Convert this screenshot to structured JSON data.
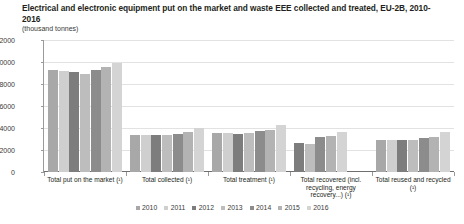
{
  "chart_data": {
    "type": "bar",
    "title": "Electrical and electronic equipment put on the market and waste EEE collected and treated, EU-2B, 2010-2016",
    "subtitle": "(thousand tonnes)",
    "xlabel": "",
    "ylabel": "",
    "unit": "thousand tonnes",
    "ylim": [
      0,
      12000
    ],
    "ytick_labels": [
      "12000",
      "10000",
      "8000",
      "6000",
      "4000",
      "2000",
      "0"
    ],
    "ytick_values": [
      12000,
      10000,
      8000,
      6000,
      4000,
      2000,
      0
    ],
    "grid": true,
    "legend_position": "bottom",
    "categories": [
      "Total put on the market (¹)",
      "Total collected (¹)",
      "Total treatment (¹)",
      "Total recovered (incl. recycling, energy recovery...) (¹)",
      "Total reused and recycled (¹)"
    ],
    "series": [
      {
        "name": "2010",
        "color": "#a8a8a8",
        "values": [
          9300,
          3400,
          3550,
          null,
          2950
        ]
      },
      {
        "name": "2011",
        "color": "#cfcfcf",
        "values": [
          9200,
          3400,
          3550,
          null,
          2950
        ]
      },
      {
        "name": "2012",
        "color": "#7d7d7d",
        "values": [
          9100,
          3400,
          3500,
          2600,
          2900
        ]
      },
      {
        "name": "2013",
        "color": "#bdbdbd",
        "values": [
          8950,
          3400,
          3550,
          2550,
          2950
        ]
      },
      {
        "name": "2014",
        "color": "#8c8c8c",
        "values": [
          9300,
          3450,
          3750,
          3150,
          3050
        ]
      },
      {
        "name": "2015",
        "color": "#b3b3b3",
        "values": [
          9550,
          3650,
          3800,
          3250,
          3150
        ]
      },
      {
        "name": "2016",
        "color": "#d4d4d4",
        "values": [
          9900,
          4000,
          4300,
          3650,
          3600
        ]
      }
    ]
  },
  "legend": {
    "items": [
      "2010",
      "2011",
      "2012",
      "2013",
      "2014",
      "2015",
      "2016"
    ]
  },
  "colors": {
    "grid": "#e2e2e2",
    "axis": "#6f6f6f",
    "text": "#231f20"
  }
}
